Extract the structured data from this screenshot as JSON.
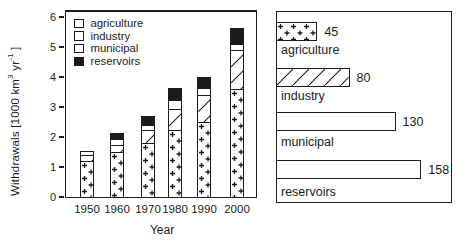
{
  "figure": {
    "ink_color": "#1b1b1b",
    "paper_color": "#ffffff"
  },
  "left_chart": {
    "ylabel_prefix": "Withdrawals [1000 km",
    "ylabel_sup1": "3",
    "ylabel_mid": " yr",
    "ylabel_sup2": "-1",
    "ylabel_suffix": " ]",
    "xlabel": "Year"
  },
  "chart_data": [
    {
      "type": "bar",
      "stacked": true,
      "title": "",
      "xlabel": "Year",
      "ylabel": "Withdrawals [1000 km³ yr⁻¹]",
      "ylim": [
        0,
        6
      ],
      "yticks": [
        0,
        1,
        2,
        3,
        4,
        5,
        6
      ],
      "grid": false,
      "legend_position": "upper-left",
      "categories": [
        "1950",
        "1960",
        "1970",
        "1980",
        "1990",
        "2000"
      ],
      "series": [
        {
          "name": "agriculture",
          "pattern": "crosses",
          "values": [
            1.2,
            1.5,
            1.8,
            2.25,
            2.5,
            3.6
          ]
        },
        {
          "name": "industry",
          "pattern": "diagonal",
          "values": [
            0.2,
            0.25,
            0.45,
            0.7,
            0.9,
            1.3
          ]
        },
        {
          "name": "municipal",
          "pattern": "plain",
          "values": [
            0.15,
            0.2,
            0.15,
            0.3,
            0.25,
            0.2
          ]
        },
        {
          "name": "reservoirs",
          "pattern": "solid",
          "values": [
            0,
            0.2,
            0.3,
            0.4,
            0.35,
            0.55
          ]
        }
      ]
    },
    {
      "type": "bar",
      "orientation": "horizontal",
      "title": "",
      "categories": [
        "agriculture",
        "industry",
        "municipal",
        "reservoirs"
      ],
      "patterns": [
        "crosses",
        "diagonal",
        "plain",
        "solid"
      ],
      "values": [
        45,
        80,
        130,
        158
      ],
      "value_labels": [
        "45",
        "80",
        "130",
        "158"
      ]
    }
  ]
}
